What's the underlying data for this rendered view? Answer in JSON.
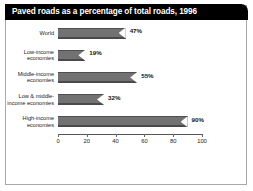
{
  "title": "Paved roads as a percentage of total roads, 1996",
  "colors": {
    "title_bar_background": "#000000",
    "title_text": "#ffffff",
    "bar_fill": "#727272",
    "frame_border": "#a8a8a8",
    "axis": "#555555",
    "plot_background": "#ffffff"
  },
  "chart_data": {
    "type": "bar",
    "orientation": "horizontal",
    "title": "Paved roads as a percentage of total roads, 1996",
    "xlabel": "",
    "ylabel": "",
    "xlim": [
      0,
      100
    ],
    "xticks": [
      0,
      20,
      40,
      60,
      80,
      100
    ],
    "xtick_labels": [
      "0",
      "20",
      "40",
      "60",
      "80",
      "100"
    ],
    "grid": false,
    "legend": false,
    "categories": [
      "World",
      "Low-income economies",
      "Middle-income economies",
      "Low & middle-income economies",
      "High-income economies"
    ],
    "values": [
      47,
      19,
      55,
      32,
      90
    ],
    "data_labels": [
      "47%",
      "19%",
      "55%",
      "32%",
      "90%"
    ],
    "bars": [
      {
        "label_lines": [
          "World"
        ],
        "value": 47,
        "data_label": "47%"
      },
      {
        "label_lines": [
          "Low-income",
          "economies"
        ],
        "value": 19,
        "data_label": "19%"
      },
      {
        "label_lines": [
          "Middle-income",
          "economies"
        ],
        "value": 55,
        "data_label": "55%"
      },
      {
        "label_lines": [
          "Low & middle-",
          "income economies"
        ],
        "value": 32,
        "data_label": "32%"
      },
      {
        "label_lines": [
          "High-income",
          "economies"
        ],
        "value": 90,
        "data_label": "90%"
      }
    ]
  }
}
